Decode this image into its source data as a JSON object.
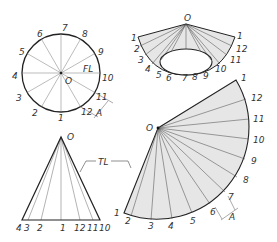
{
  "colors": {
    "line": "#222222",
    "thin": "#555555",
    "fill": "#e6e6e6",
    "text": "#333333"
  },
  "top_view": {
    "center_label": "O",
    "fl_label": "FL",
    "points": [
      "1",
      "2",
      "3",
      "4",
      "5",
      "6",
      "7",
      "8",
      "9",
      "10",
      "11",
      "12"
    ],
    "dimension_label": "A"
  },
  "pictorial": {
    "apex_label": "O",
    "left_labels": [
      "1",
      "2",
      "3",
      "4",
      "5",
      "6",
      "7",
      "8"
    ],
    "right_labels": [
      "1",
      "12",
      "11",
      "10",
      "9"
    ]
  },
  "front_view": {
    "apex_label": "O",
    "base_labels": [
      "4",
      "3",
      "2",
      "1",
      "12",
      "11",
      "10"
    ],
    "tl_label": "TL"
  },
  "development": {
    "apex_label": "O",
    "arc_labels": [
      "1",
      "2",
      "3",
      "4",
      "5",
      "6",
      "7",
      "8",
      "9",
      "10",
      "11",
      "12",
      "1"
    ],
    "dimension_label": "A"
  }
}
